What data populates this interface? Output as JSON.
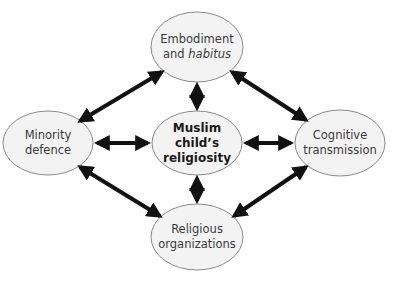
{
  "diagram": {
    "type": "hub-and-spoke with ring",
    "nodes": [
      {
        "id": "embodiment",
        "line1": "Embodiment",
        "line2_prefix": "and ",
        "line2_italic": "habitus",
        "position": "top",
        "cx": 197,
        "cy": 47,
        "rx": 46,
        "ry": 35
      },
      {
        "id": "minority",
        "line1": "Minority",
        "line2": "defence",
        "position": "left",
        "cx": 48,
        "cy": 143,
        "rx": 45,
        "ry": 32
      },
      {
        "id": "center",
        "line1": "Muslim",
        "line2": "child’s",
        "line3": "religiosity",
        "position": "center",
        "cx": 197,
        "cy": 143,
        "rx": 45,
        "ry": 32,
        "bold": true
      },
      {
        "id": "cognitive",
        "line1": "Cognitive",
        "line2": "transmission",
        "position": "right",
        "cx": 340,
        "cy": 143,
        "rx": 45,
        "ry": 33
      },
      {
        "id": "religious",
        "line1": "Religious",
        "line2": "organizations",
        "position": "bottom",
        "cx": 197,
        "cy": 237,
        "rx": 46,
        "ry": 33
      }
    ],
    "edges": [
      {
        "from": "embodiment",
        "to": "center",
        "bidirectional": true
      },
      {
        "from": "minority",
        "to": "center",
        "bidirectional": true
      },
      {
        "from": "cognitive",
        "to": "center",
        "bidirectional": true
      },
      {
        "from": "religious",
        "to": "center",
        "bidirectional": true
      },
      {
        "from": "embodiment",
        "to": "minority",
        "bidirectional": true
      },
      {
        "from": "embodiment",
        "to": "cognitive",
        "bidirectional": true
      },
      {
        "from": "religious",
        "to": "minority",
        "bidirectional": true
      },
      {
        "from": "religious",
        "to": "cognitive",
        "bidirectional": true
      }
    ],
    "colors": {
      "ellipse_fill": "#f3f3f3",
      "ellipse_stroke": "#8a8a8a",
      "arrow": "#111111",
      "text": "#3a3a3a"
    }
  }
}
